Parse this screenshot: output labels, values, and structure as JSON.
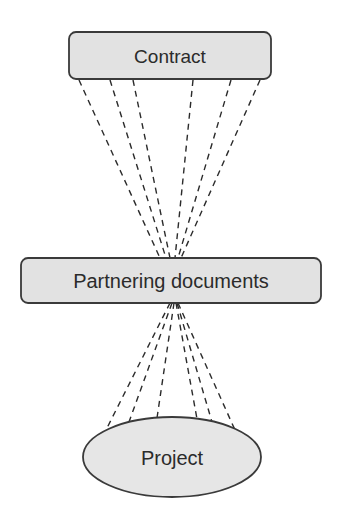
{
  "diagram": {
    "nodes": {
      "contract": {
        "label": "Contract",
        "shape": "rounded-rectangle"
      },
      "partnering": {
        "label": "Partnering documents",
        "shape": "rounded-rectangle"
      },
      "project": {
        "label": "Project",
        "shape": "ellipse"
      }
    },
    "edges": [
      {
        "from": "contract",
        "to": "partnering",
        "style": "dashed",
        "count": 6
      },
      {
        "from": "partnering",
        "to": "project",
        "style": "dashed",
        "count": 6
      }
    ],
    "colors": {
      "node_fill": "#e2e2e2",
      "node_stroke": "#3a3a3a",
      "line": "#2b2b2b",
      "text": "#2b2b2b"
    }
  }
}
